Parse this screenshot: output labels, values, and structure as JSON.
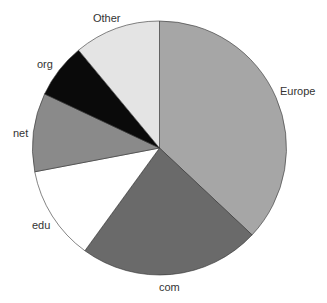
{
  "chart_data": {
    "type": "pie",
    "title": "",
    "start_angle_deg": 0,
    "direction": "clockwise",
    "categories": [
      "Europe",
      "com",
      "edu",
      "net",
      "org",
      "Other"
    ],
    "values": [
      37,
      23,
      12,
      10,
      7,
      11
    ],
    "unit": "percent",
    "colors": [
      "#a6a6a6",
      "#6a6a6a",
      "#ffffff",
      "#8a8a8a",
      "#0a0a0a",
      "#e4e4e4"
    ],
    "legend": "none",
    "labels_outside": true
  },
  "layout": {
    "cx": 159.5,
    "cy": 148,
    "r": 127,
    "label_positions": [
      {
        "x": 280,
        "y": 95,
        "anchor": "start"
      },
      {
        "x": 159,
        "y": 291,
        "anchor": "start"
      },
      {
        "x": 32,
        "y": 229,
        "anchor": "start"
      },
      {
        "x": 13,
        "y": 137,
        "anchor": "start"
      },
      {
        "x": 37,
        "y": 68,
        "anchor": "start"
      },
      {
        "x": 93,
        "y": 22,
        "anchor": "start"
      }
    ]
  }
}
